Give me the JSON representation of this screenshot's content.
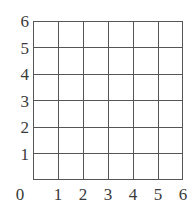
{
  "figure": {
    "background_color": "#ffffff",
    "line_color": "#555555",
    "label_color": "#3a3a3a"
  },
  "chart_data": {
    "type": "line",
    "title": "",
    "subtitle": "",
    "xlabel": "",
    "ylabel": "",
    "grid": true,
    "legend": null,
    "series": [],
    "x": [],
    "values": [],
    "xlim": [
      0,
      6
    ],
    "ylim": [
      0,
      6
    ],
    "x_ticks": [
      0,
      1,
      2,
      3,
      4,
      5,
      6
    ],
    "y_ticks": [
      1,
      2,
      3,
      4,
      5,
      6
    ],
    "x_tick_labels": [
      "0",
      "1",
      "2",
      "3",
      "4",
      "5",
      "6"
    ],
    "y_tick_labels": [
      "1",
      "2",
      "3",
      "4",
      "5",
      "6"
    ],
    "columns": 6,
    "rows": 6,
    "origin_label": "0"
  }
}
